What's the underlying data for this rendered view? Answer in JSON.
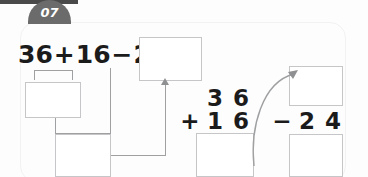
{
  "badge": {
    "number": "07"
  },
  "problem": {
    "expression": {
      "a": "36",
      "plus": "+",
      "b": "16",
      "minus": "−",
      "c": "24",
      "equals": "="
    },
    "answer_boxes": {
      "result": "",
      "partial_sum": "",
      "partial_difference": "",
      "vertical_sum": "",
      "vertical_minuend": "",
      "vertical_difference": ""
    },
    "vertical_addition": {
      "top_tens": "3",
      "top_ones": "6",
      "operator": "+",
      "bottom_tens": "1",
      "bottom_ones": "6"
    },
    "vertical_subtraction": {
      "operator": "−",
      "tens": "2",
      "ones": "4"
    }
  },
  "colors": {
    "badge_bg": "#6b6b6b",
    "badge_text": "#ffffff",
    "ink": "#1b1b1b",
    "box_border": "#c6c6c8",
    "connector": "#9fa0a2",
    "rule": "#4a4a4a",
    "card_outline": "#f2f2f4"
  }
}
